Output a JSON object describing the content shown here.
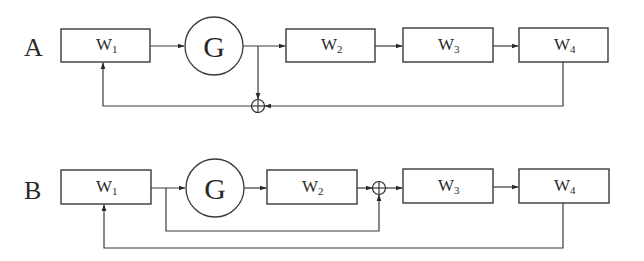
{
  "diagrams": [
    {
      "id": "A",
      "label": "A",
      "blocks": [
        {
          "name": "W",
          "sub": "1"
        },
        {
          "name": "G"
        },
        {
          "name": "W",
          "sub": "2"
        },
        {
          "name": "W",
          "sub": "3"
        },
        {
          "name": "W",
          "sub": "4"
        }
      ],
      "junction_symbol": "sum",
      "description": "W1 -> G -> W2 -> W3 -> W4; G output and W4 output summed and fed back to W1"
    },
    {
      "id": "B",
      "label": "B",
      "blocks": [
        {
          "name": "W",
          "sub": "1"
        },
        {
          "name": "G"
        },
        {
          "name": "W",
          "sub": "2"
        },
        {
          "name": "W",
          "sub": "3"
        },
        {
          "name": "W",
          "sub": "4"
        }
      ],
      "junction_symbol": "sum",
      "description": "W1 -> G -> W2 -> sum -> W3 -> W4; W1 output bypasses G/W2 to sum; W4 output fed back to W1"
    }
  ],
  "colors": {
    "stroke": "#3a3a3a",
    "background": "#ffffff"
  }
}
